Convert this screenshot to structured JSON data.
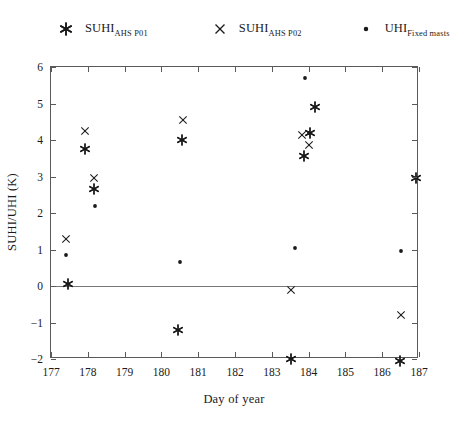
{
  "chart_data": {
    "type": "scatter",
    "title": "",
    "xlabel": "Day of year",
    "ylabel": "SUHI/UHI (K)",
    "xlim": [
      177,
      187
    ],
    "ylim": [
      -2,
      6
    ],
    "xticks": [
      177,
      178,
      179,
      180,
      181,
      182,
      183,
      184,
      185,
      186,
      187
    ],
    "yticks": [
      -2,
      -1,
      0,
      1,
      2,
      3,
      4,
      5,
      6
    ],
    "grid": false,
    "legend_position": "top",
    "annotations": [
      {
        "type": "reference-line",
        "axis": "y",
        "value": 0
      }
    ],
    "series": [
      {
        "name": "SUHI_AHS P01",
        "marker": "asterisk",
        "color": "#1a1a1a",
        "points": [
          {
            "x": 177.45,
            "y": 0.05
          },
          {
            "x": 177.92,
            "y": 3.75
          },
          {
            "x": 178.18,
            "y": 2.65
          },
          {
            "x": 180.57,
            "y": 4.0
          },
          {
            "x": 180.45,
            "y": -1.2
          },
          {
            "x": 183.88,
            "y": 3.55
          },
          {
            "x": 184.18,
            "y": 4.9
          },
          {
            "x": 184.05,
            "y": 4.2
          },
          {
            "x": 183.52,
            "y": -2.0
          },
          {
            "x": 186.48,
            "y": -2.05
          },
          {
            "x": 186.92,
            "y": 2.95
          }
        ]
      },
      {
        "name": "SUHI_AHS P02",
        "marker": "cross",
        "color": "#1a1a1a",
        "points": [
          {
            "x": 177.42,
            "y": 1.3
          },
          {
            "x": 177.92,
            "y": 4.25
          },
          {
            "x": 178.18,
            "y": 2.95
          },
          {
            "x": 180.6,
            "y": 4.55
          },
          {
            "x": 183.82,
            "y": 4.15
          },
          {
            "x": 184.0,
            "y": 3.85
          },
          {
            "x": 183.52,
            "y": -0.1
          },
          {
            "x": 186.5,
            "y": -0.8
          }
        ]
      },
      {
        "name": "UHI_Fixed masts",
        "marker": "dot",
        "color": "#1a1a1a",
        "points": [
          {
            "x": 177.4,
            "y": 0.85
          },
          {
            "x": 178.2,
            "y": 2.2
          },
          {
            "x": 180.5,
            "y": 0.65
          },
          {
            "x": 183.9,
            "y": 5.7
          },
          {
            "x": 184.02,
            "y": 4.18
          },
          {
            "x": 183.62,
            "y": 1.05
          },
          {
            "x": 186.52,
            "y": 0.95
          }
        ]
      }
    ]
  },
  "legend": {
    "entries": [
      {
        "marker": "asterisk",
        "base": "SUHI",
        "sub": "AHS P01"
      },
      {
        "marker": "cross",
        "base": "SUHI",
        "sub": "AHS P02"
      },
      {
        "marker": "dot",
        "base": "UHI",
        "sub": "Fixed masts"
      }
    ]
  },
  "axes": {
    "x_title": "Day of year",
    "y_title": "SUHI/UHI (K)"
  },
  "colors": {
    "marker": "#1a1a1a",
    "frame": "#5a5a5a",
    "zero_line": "#787878",
    "background": "#ffffff"
  }
}
